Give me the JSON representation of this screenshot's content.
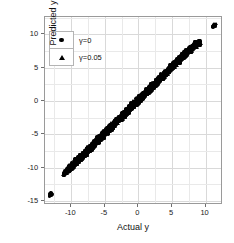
{
  "chart_data": {
    "type": "scatter",
    "title": "",
    "xlabel": "Actual y",
    "ylabel": "Predicted y",
    "xlim": [
      -13.9,
      12.6
    ],
    "ylim": [
      -15.6,
      12.6
    ],
    "xticks": [
      -10,
      -5,
      0,
      5,
      10
    ],
    "xticklabels": [
      "-10",
      "-5",
      "0",
      "5",
      "10"
    ],
    "yticks": [
      10,
      5,
      0,
      -5,
      -10,
      -15
    ],
    "yticklabels": [
      "10",
      "5",
      "0",
      "-5",
      "-10",
      "-15"
    ],
    "grid": true,
    "grid_minor": true,
    "legend_position": "upper-left-inside",
    "marker_color": "#000000",
    "series": [
      {
        "name": "γ=0",
        "marker": "circle",
        "color": "#000000",
        "points": [
          [
            -13.05,
            -14.0
          ],
          [
            -12.95,
            -13.9
          ],
          [
            -13.1,
            -14.1
          ],
          [
            -11.1,
            -11.0
          ],
          [
            -11.0,
            -10.85
          ],
          [
            -10.9,
            -10.7
          ],
          [
            -10.75,
            -10.6
          ],
          [
            -10.6,
            -10.4
          ],
          [
            -10.45,
            -10.3
          ],
          [
            -10.3,
            -10.15
          ],
          [
            -10.15,
            -10.0
          ],
          [
            -10.0,
            -9.9
          ],
          [
            -9.85,
            -9.7
          ],
          [
            -9.7,
            -9.6
          ],
          [
            -9.55,
            -9.4
          ],
          [
            -9.4,
            -9.3
          ],
          [
            -9.25,
            -9.1
          ],
          [
            -9.1,
            -9.0
          ],
          [
            -8.95,
            -8.8
          ],
          [
            -8.8,
            -8.7
          ],
          [
            -8.65,
            -8.5
          ],
          [
            -8.5,
            -8.4
          ],
          [
            -8.35,
            -8.2
          ],
          [
            -8.2,
            -8.1
          ],
          [
            -8.05,
            -7.9
          ],
          [
            -7.9,
            -7.8
          ],
          [
            -7.75,
            -7.6
          ],
          [
            -7.6,
            -7.5
          ],
          [
            -7.45,
            -7.3
          ],
          [
            -7.3,
            -7.2
          ],
          [
            -7.15,
            -7.0
          ],
          [
            -7.0,
            -6.9
          ],
          [
            -6.85,
            -6.7
          ],
          [
            -6.7,
            -6.6
          ],
          [
            -6.55,
            -6.4
          ],
          [
            -6.4,
            -6.3
          ],
          [
            -6.25,
            -6.1
          ],
          [
            -6.1,
            -6.0
          ],
          [
            -5.95,
            -5.8
          ],
          [
            -5.8,
            -5.7
          ],
          [
            -5.65,
            -5.5
          ],
          [
            -5.5,
            -5.4
          ],
          [
            -5.35,
            -5.2
          ],
          [
            -5.2,
            -5.1
          ],
          [
            -5.05,
            -4.9
          ],
          [
            -4.9,
            -4.8
          ],
          [
            -4.75,
            -4.6
          ],
          [
            -4.6,
            -4.5
          ],
          [
            -4.45,
            -4.3
          ],
          [
            -4.3,
            -4.2
          ],
          [
            -4.15,
            -4.0
          ],
          [
            -4.0,
            -3.9
          ],
          [
            -3.85,
            -3.7
          ],
          [
            -3.7,
            -3.6
          ],
          [
            -3.55,
            -3.4
          ],
          [
            -3.4,
            -3.3
          ],
          [
            -3.25,
            -3.1
          ],
          [
            -3.1,
            -3.0
          ],
          [
            -2.95,
            -2.8
          ],
          [
            -2.8,
            -2.7
          ],
          [
            -2.65,
            -2.5
          ],
          [
            -2.5,
            -2.4
          ],
          [
            -2.35,
            -2.2
          ],
          [
            -2.2,
            -2.1
          ],
          [
            -2.05,
            -1.9
          ],
          [
            -1.9,
            -1.8
          ],
          [
            -1.75,
            -1.6
          ],
          [
            -1.6,
            -1.5
          ],
          [
            -1.45,
            -1.3
          ],
          [
            -1.3,
            -1.2
          ],
          [
            -1.15,
            -1.0
          ],
          [
            -1.0,
            -0.9
          ],
          [
            -0.85,
            -0.7
          ],
          [
            -0.7,
            -0.6
          ],
          [
            -0.55,
            -0.4
          ],
          [
            -0.4,
            -0.3
          ],
          [
            -0.25,
            -0.1
          ],
          [
            -0.1,
            0.0
          ],
          [
            0.05,
            0.15
          ],
          [
            0.2,
            0.3
          ],
          [
            0.35,
            0.45
          ],
          [
            0.5,
            0.6
          ],
          [
            0.65,
            0.75
          ],
          [
            0.8,
            0.9
          ],
          [
            0.95,
            1.05
          ],
          [
            1.1,
            1.2
          ],
          [
            1.25,
            1.35
          ],
          [
            1.4,
            1.5
          ],
          [
            1.55,
            1.65
          ],
          [
            1.7,
            1.8
          ],
          [
            1.85,
            1.95
          ],
          [
            2.0,
            2.1
          ],
          [
            2.15,
            2.25
          ],
          [
            2.3,
            2.4
          ],
          [
            2.45,
            2.55
          ],
          [
            2.6,
            2.7
          ],
          [
            2.75,
            2.85
          ],
          [
            2.9,
            3.0
          ],
          [
            3.05,
            3.15
          ],
          [
            3.2,
            3.3
          ],
          [
            3.35,
            3.45
          ],
          [
            3.5,
            3.6
          ],
          [
            3.65,
            3.75
          ],
          [
            3.8,
            3.9
          ],
          [
            3.95,
            4.05
          ],
          [
            4.1,
            4.2
          ],
          [
            4.25,
            4.35
          ],
          [
            4.4,
            4.5
          ],
          [
            4.55,
            4.65
          ],
          [
            4.7,
            4.8
          ],
          [
            4.85,
            4.95
          ],
          [
            5.0,
            5.1
          ],
          [
            5.15,
            5.25
          ],
          [
            5.3,
            5.4
          ],
          [
            5.45,
            5.55
          ],
          [
            5.6,
            5.7
          ],
          [
            5.75,
            5.85
          ],
          [
            5.9,
            6.0
          ],
          [
            6.05,
            6.1
          ],
          [
            6.2,
            6.25
          ],
          [
            6.35,
            6.4
          ],
          [
            6.5,
            6.55
          ],
          [
            6.65,
            6.7
          ],
          [
            6.8,
            6.85
          ],
          [
            6.95,
            7.0
          ],
          [
            7.1,
            7.15
          ],
          [
            7.25,
            7.3
          ],
          [
            7.4,
            7.45
          ],
          [
            7.55,
            7.6
          ],
          [
            7.7,
            7.75
          ],
          [
            7.85,
            7.9
          ],
          [
            8.0,
            8.0
          ],
          [
            8.2,
            8.15
          ],
          [
            8.4,
            8.3
          ],
          [
            8.6,
            8.45
          ],
          [
            8.8,
            8.6
          ],
          [
            9.0,
            8.7
          ],
          [
            11.25,
            11.2
          ],
          [
            11.35,
            11.35
          ]
        ]
      },
      {
        "name": "γ=0.05",
        "marker": "triangle",
        "color": "#000000",
        "points": [
          [
            -13.0,
            -13.95
          ],
          [
            -12.9,
            -13.85
          ],
          [
            -11.15,
            -11.05
          ],
          [
            -11.05,
            -10.9
          ],
          [
            -10.85,
            -10.75
          ],
          [
            -10.7,
            -10.55
          ],
          [
            -10.55,
            -10.45
          ],
          [
            -10.4,
            -10.25
          ],
          [
            -10.25,
            -10.1
          ],
          [
            -10.1,
            -9.95
          ],
          [
            -9.95,
            -9.85
          ],
          [
            -9.8,
            -9.65
          ],
          [
            -9.65,
            -9.55
          ],
          [
            -9.5,
            -9.35
          ],
          [
            -9.35,
            -9.25
          ],
          [
            -9.2,
            -9.05
          ],
          [
            -9.05,
            -8.95
          ],
          [
            -8.9,
            -8.75
          ],
          [
            -8.75,
            -8.65
          ],
          [
            -8.6,
            -8.45
          ],
          [
            -8.45,
            -8.35
          ],
          [
            -8.3,
            -8.15
          ],
          [
            -8.15,
            -8.05
          ],
          [
            -8.0,
            -7.85
          ],
          [
            -7.85,
            -7.75
          ],
          [
            -7.7,
            -7.55
          ],
          [
            -7.55,
            -7.45
          ],
          [
            -7.4,
            -7.25
          ],
          [
            -7.25,
            -7.15
          ],
          [
            -7.1,
            -6.95
          ],
          [
            -6.95,
            -6.85
          ],
          [
            -6.8,
            -6.65
          ],
          [
            -6.65,
            -6.55
          ],
          [
            -6.5,
            -6.35
          ],
          [
            -6.35,
            -6.25
          ],
          [
            -6.2,
            -6.05
          ],
          [
            -6.05,
            -5.95
          ],
          [
            -5.9,
            -5.75
          ],
          [
            -5.75,
            -5.65
          ],
          [
            -5.6,
            -5.45
          ],
          [
            -5.45,
            -5.35
          ],
          [
            -5.3,
            -5.15
          ],
          [
            -5.15,
            -5.05
          ],
          [
            -5.0,
            -4.85
          ],
          [
            -4.85,
            -4.75
          ],
          [
            -4.7,
            -4.55
          ],
          [
            -4.55,
            -4.45
          ],
          [
            -4.4,
            -4.25
          ],
          [
            -4.25,
            -4.15
          ],
          [
            -4.1,
            -3.95
          ],
          [
            -3.95,
            -3.85
          ],
          [
            -3.8,
            -3.65
          ],
          [
            -3.65,
            -3.55
          ],
          [
            -3.5,
            -3.35
          ],
          [
            -3.35,
            -3.25
          ],
          [
            -3.2,
            -3.05
          ],
          [
            -3.05,
            -2.95
          ],
          [
            -2.9,
            -2.75
          ],
          [
            -2.75,
            -2.65
          ],
          [
            -2.6,
            -2.45
          ],
          [
            -2.45,
            -2.35
          ],
          [
            -2.3,
            -2.15
          ],
          [
            -2.15,
            -2.05
          ],
          [
            -2.0,
            -1.85
          ],
          [
            -1.85,
            -1.75
          ],
          [
            -1.7,
            -1.55
          ],
          [
            -1.55,
            -1.45
          ],
          [
            -1.4,
            -1.25
          ],
          [
            -1.25,
            -1.15
          ],
          [
            -1.1,
            -0.95
          ],
          [
            -0.95,
            -0.85
          ],
          [
            -0.8,
            -0.65
          ],
          [
            -0.65,
            -0.55
          ],
          [
            -0.5,
            -0.35
          ],
          [
            -0.35,
            -0.25
          ],
          [
            -0.2,
            -0.05
          ],
          [
            -0.05,
            0.05
          ],
          [
            0.1,
            0.2
          ],
          [
            0.25,
            0.35
          ],
          [
            0.4,
            0.5
          ],
          [
            0.55,
            0.65
          ],
          [
            0.7,
            0.8
          ],
          [
            0.85,
            0.95
          ],
          [
            1.0,
            1.1
          ],
          [
            1.15,
            1.25
          ],
          [
            1.3,
            1.4
          ],
          [
            1.45,
            1.55
          ],
          [
            1.6,
            1.7
          ],
          [
            1.75,
            1.85
          ],
          [
            1.9,
            2.0
          ],
          [
            2.05,
            2.15
          ],
          [
            2.2,
            2.3
          ],
          [
            2.35,
            2.45
          ],
          [
            2.5,
            2.6
          ],
          [
            2.65,
            2.75
          ],
          [
            2.8,
            2.9
          ],
          [
            2.95,
            3.05
          ],
          [
            3.1,
            3.2
          ],
          [
            3.25,
            3.35
          ],
          [
            3.4,
            3.5
          ],
          [
            3.55,
            3.65
          ],
          [
            3.7,
            3.8
          ],
          [
            3.85,
            3.95
          ],
          [
            4.0,
            4.1
          ],
          [
            4.15,
            4.25
          ],
          [
            4.3,
            4.4
          ],
          [
            4.45,
            4.55
          ],
          [
            4.6,
            4.7
          ],
          [
            4.75,
            4.85
          ],
          [
            4.9,
            5.0
          ],
          [
            5.05,
            5.15
          ],
          [
            5.2,
            5.3
          ],
          [
            5.35,
            5.45
          ],
          [
            5.5,
            5.6
          ],
          [
            5.65,
            5.75
          ],
          [
            5.8,
            5.9
          ],
          [
            5.95,
            6.05
          ],
          [
            6.1,
            6.15
          ],
          [
            6.25,
            6.3
          ],
          [
            6.4,
            6.45
          ],
          [
            6.55,
            6.6
          ],
          [
            6.7,
            6.75
          ],
          [
            6.85,
            6.9
          ],
          [
            7.0,
            7.05
          ],
          [
            7.15,
            7.2
          ],
          [
            7.3,
            7.35
          ],
          [
            7.45,
            7.5
          ],
          [
            7.6,
            7.65
          ],
          [
            7.75,
            7.8
          ],
          [
            7.9,
            7.95
          ],
          [
            8.1,
            8.1
          ],
          [
            8.3,
            8.25
          ],
          [
            8.5,
            8.4
          ],
          [
            8.7,
            8.55
          ],
          [
            8.9,
            8.65
          ],
          [
            9.1,
            8.75
          ],
          [
            11.3,
            11.3
          ],
          [
            11.4,
            11.45
          ]
        ]
      }
    ],
    "legend": [
      {
        "label": "γ=0",
        "marker": "circle"
      },
      {
        "label": "γ=0.05",
        "marker": "triangle"
      }
    ]
  }
}
